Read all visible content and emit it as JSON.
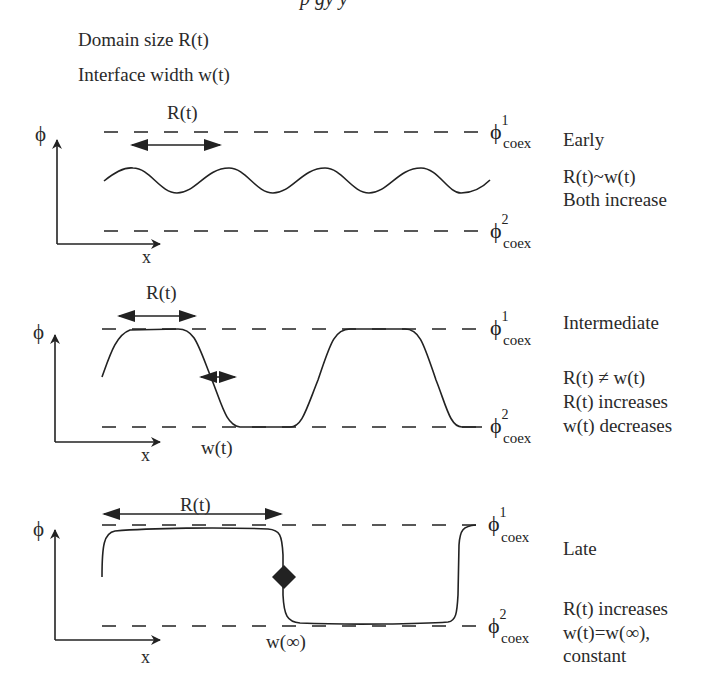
{
  "header": {
    "cutoff_fragment": "p   gy   y",
    "legend_line_1": "Domain size R(t)",
    "legend_line_2": "Interface width w(t)"
  },
  "axes": {
    "y_label": "ϕ",
    "x_label": "x"
  },
  "coex_labels": {
    "upper_symbol": "ϕ",
    "upper_superscript": "1",
    "lower_symbol": "ϕ",
    "lower_superscript": "2",
    "subscript": "coex"
  },
  "panels": [
    {
      "stage": "Early",
      "domain_arrow_label": "R(t)",
      "notes": [
        "R(t)~w(t)",
        "Both increase"
      ]
    },
    {
      "stage": "Intermediate",
      "domain_arrow_label": "R(t)",
      "interface_label": "w(t)",
      "notes": [
        "R(t) ≠ w(t)",
        "R(t) increases",
        "w(t) decreases"
      ]
    },
    {
      "stage": "Late",
      "domain_arrow_label": "R(t)",
      "interface_label": "w(∞)",
      "notes": [
        "R(t) increases",
        "w(t)=w(∞),",
        "constant"
      ]
    }
  ],
  "colors": {
    "ink": "#222222",
    "background": "#ffffff"
  }
}
